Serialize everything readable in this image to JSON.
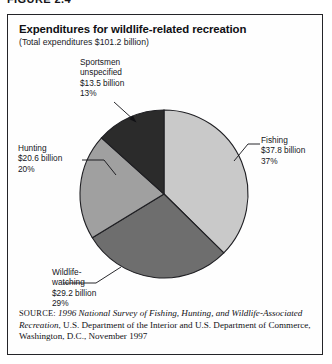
{
  "figure": {
    "caption": "FIGURE 2.4",
    "title": "Expenditures for wildlife-related recreation",
    "subtitle": "(Total expenditures $101.2 billion)",
    "source_tag": "SOURCE:",
    "source_italic": "1996 National Survey of Fishing, Hunting, and Wildlife-Associated Recreation",
    "source_rest": ", U.S. Department of the Interior and U.S. Department of Commerce, Washington, D.C., November 1997"
  },
  "labels": {
    "fishing": {
      "name": "Fishing",
      "amount": "$37.8 billion",
      "percent": "37%"
    },
    "wildlife": {
      "name_line1": "Wildlife-",
      "name_line2": "watching",
      "amount": "$29.2 billion",
      "percent": "29%"
    },
    "hunting": {
      "name": "Hunting",
      "amount": "$20.6 billion",
      "percent": "20%"
    },
    "sportsmen": {
      "name_line1": "Sportsmen",
      "name_line2": "unspecified",
      "amount": "$13.5 billion",
      "percent": "13%"
    }
  },
  "chart_data": {
    "type": "pie",
    "title": "Expenditures for wildlife-related recreation",
    "subtitle": "(Total expenditures $101.2 billion)",
    "total": 101.2,
    "units": "billion USD",
    "start_angle_deg": 0,
    "direction": "clockwise",
    "legend": "callout-labels",
    "grid": false,
    "categories": [
      "Fishing",
      "Wildlife-watching",
      "Hunting",
      "Sportsmen unspecified"
    ],
    "values": [
      37.8,
      29.2,
      20.6,
      13.5
    ],
    "percents": [
      37,
      29,
      20,
      13
    ],
    "colors": [
      "#c9c9c9",
      "#6e6e6e",
      "#a0a0a0",
      "#2b2b2b"
    ],
    "slice_geometry": {
      "center_x": 163,
      "center_y": 186,
      "radius": 84,
      "stroke": "#1f1f23"
    }
  }
}
